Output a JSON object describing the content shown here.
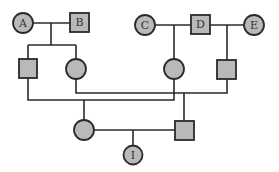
{
  "diagram": {
    "type": "pedigree-chart",
    "colors": {
      "fill": "#b9b9b9",
      "stroke": "#2a2a2a",
      "background": "#ffffff"
    },
    "individuals": [
      {
        "id": "A",
        "label": "A",
        "sex": "female",
        "generation": 1
      },
      {
        "id": "B",
        "label": "B",
        "sex": "male",
        "generation": 1
      },
      {
        "id": "C",
        "label": "C",
        "sex": "female",
        "generation": 1
      },
      {
        "id": "D",
        "label": "D",
        "sex": "male",
        "generation": 1
      },
      {
        "id": "E",
        "label": "E",
        "sex": "female",
        "generation": 1
      },
      {
        "id": "AB_son",
        "label": "",
        "sex": "male",
        "generation": 2
      },
      {
        "id": "AB_daughter",
        "label": "",
        "sex": "female",
        "generation": 2
      },
      {
        "id": "CD_daughter",
        "label": "",
        "sex": "female",
        "generation": 2
      },
      {
        "id": "DE_son",
        "label": "",
        "sex": "male",
        "generation": 2
      },
      {
        "id": "G3_female",
        "label": "",
        "sex": "female",
        "generation": 3
      },
      {
        "id": "G3_male",
        "label": "",
        "sex": "male",
        "generation": 3
      },
      {
        "id": "I",
        "label": "I",
        "sex": "female",
        "generation": 4
      }
    ],
    "matings": [
      {
        "parents": [
          "A",
          "B"
        ],
        "children": [
          "AB_son",
          "AB_daughter"
        ]
      },
      {
        "parents": [
          "C",
          "D"
        ],
        "children": [
          "CD_daughter"
        ]
      },
      {
        "parents": [
          "D",
          "E"
        ],
        "children": [
          "DE_son"
        ]
      },
      {
        "parents": [
          "AB_son",
          "CD_daughter"
        ],
        "children": [
          "G3_female"
        ]
      },
      {
        "parents": [
          "AB_daughter",
          "DE_son"
        ],
        "children": [
          "G3_male"
        ]
      },
      {
        "parents": [
          "G3_female",
          "G3_male"
        ],
        "children": [
          "I"
        ]
      }
    ]
  }
}
